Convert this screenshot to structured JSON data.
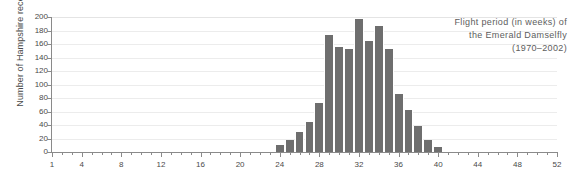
{
  "chart_data": {
    "type": "bar",
    "title_lines": [
      "Flight period (in weeks) of",
      "the Emerald Damselfly",
      "(1970–2002)"
    ],
    "xlabel": "",
    "ylabel": "Number of Hampshire records",
    "xlim": [
      1,
      52
    ],
    "ylim": [
      0,
      200
    ],
    "ytick_step": 20,
    "yticks": [
      0,
      20,
      40,
      60,
      80,
      100,
      120,
      140,
      160,
      180,
      200
    ],
    "ytick_labels": [
      "0",
      "20",
      "40",
      "60",
      "80",
      "100",
      "120",
      "140",
      "160",
      "180",
      "200"
    ],
    "xticks_major": [
      1,
      4,
      8,
      12,
      16,
      20,
      24,
      28,
      32,
      36,
      40,
      44,
      48,
      52
    ],
    "xtick_labels": [
      "1",
      "4",
      "8",
      "12",
      "16",
      "20",
      "24",
      "28",
      "32",
      "36",
      "40",
      "44",
      "48",
      "52"
    ],
    "grid": true,
    "legend": "none",
    "bar_color": "#6e6e6e",
    "grid_color": "#ececec",
    "axis_color": "#8a8a8a",
    "text_color": "#4a4a4a",
    "title_color": "#5d5d5d",
    "categories": [
      24,
      25,
      26,
      27,
      28,
      29,
      30,
      31,
      32,
      33,
      34,
      35,
      36,
      37,
      38,
      39,
      40
    ],
    "values": [
      10,
      18,
      30,
      45,
      72,
      173,
      155,
      152,
      197,
      165,
      187,
      152,
      86,
      62,
      38,
      18,
      8
    ]
  }
}
